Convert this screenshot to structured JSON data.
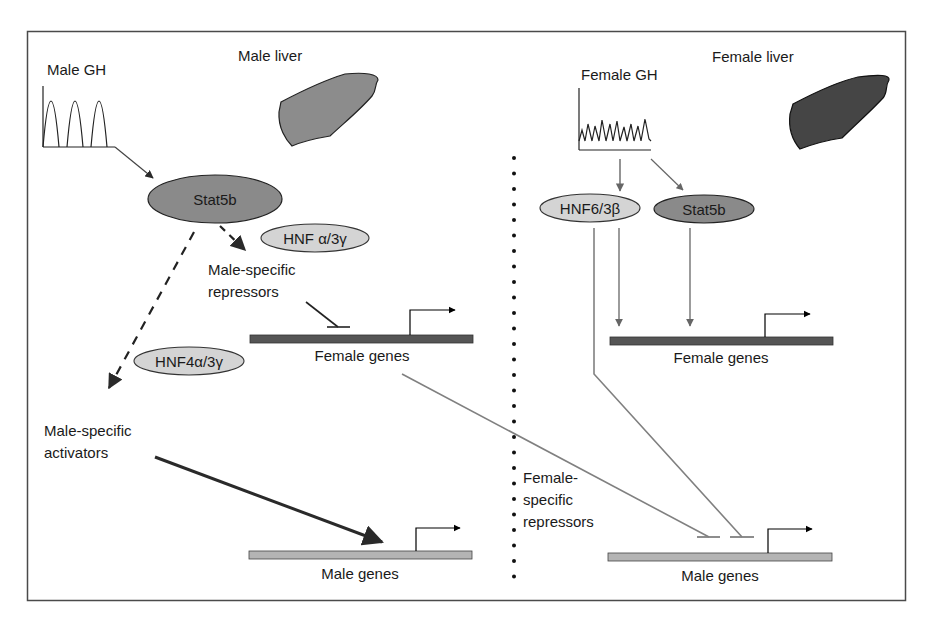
{
  "colors": {
    "border": "#4a4a4a",
    "stat5b_fill": "#8a8a8a",
    "hnf_fill": "#d4d4d4",
    "male_liver_fill": "#8c8c8c",
    "female_liver_fill": "#454545",
    "female_gene_bar": "#555555",
    "male_gene_bar": "#b4b4b4",
    "gray_line": "#808080",
    "dark_arrow": "#2a2a2a"
  },
  "male_panel": {
    "title": "Male liver",
    "gh_label": "Male GH",
    "stat5b_label": "Stat5b",
    "hnf_cofactor_label": "HNF α/3γ",
    "repressors_label_line1": "Male-specific",
    "repressors_label_line2": "repressors",
    "hnf4_label": "HNF4α/3γ",
    "activators_label_line1": "Male-specific",
    "activators_label_line2": "activators",
    "female_genes_label": "Female genes",
    "male_genes_label": "Male genes"
  },
  "female_panel": {
    "title": "Female liver",
    "gh_label": "Female GH",
    "hnf6_label": "HNF6/3β",
    "stat5b_label": "Stat5b",
    "female_genes_label": "Female genes",
    "repressors_label_line1": "Female-",
    "repressors_label_line2": "specific",
    "repressors_label_line3": "repressors",
    "male_genes_label": "Male genes"
  }
}
